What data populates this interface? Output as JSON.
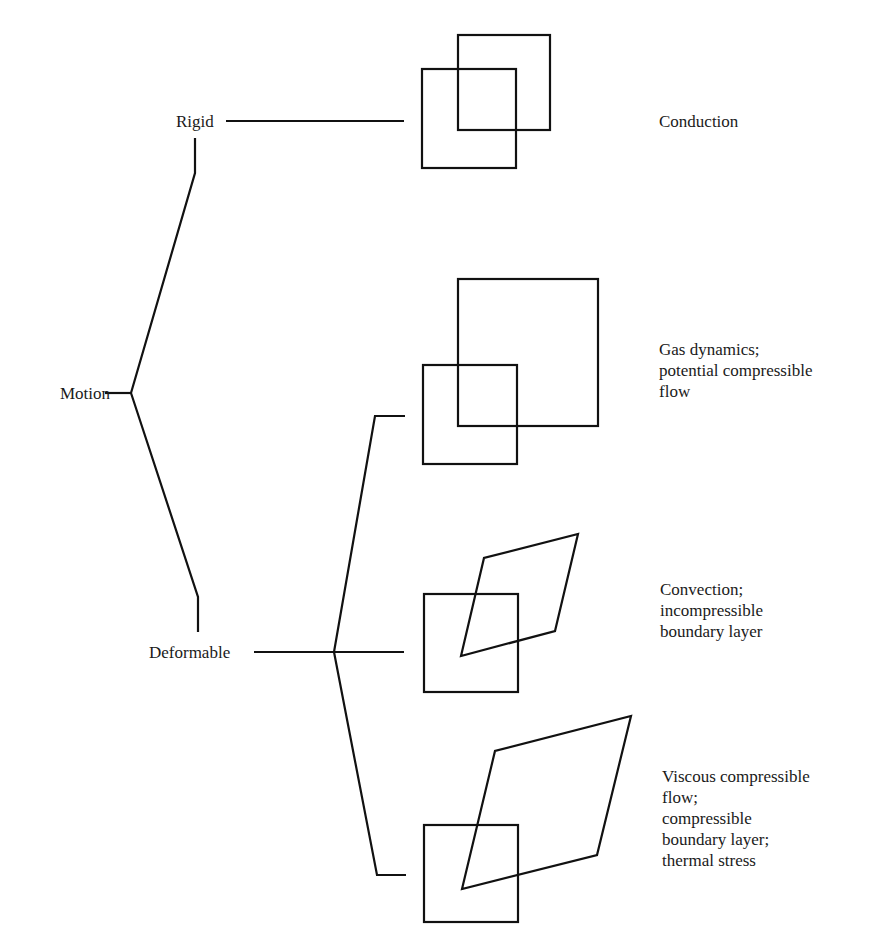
{
  "diagram": {
    "root": {
      "label": "Motion"
    },
    "branches": [
      {
        "label": "Rigid"
      },
      {
        "label": "Deformable"
      }
    ],
    "cases": [
      {
        "parent": "Rigid",
        "shape": "two-translated-squares",
        "description_lines": [
          "Conduction"
        ]
      },
      {
        "parent": "Deformable",
        "shape": "square-and-dilated-square",
        "description_lines": [
          "Gas dynamics;",
          "potential compressible",
          "flow"
        ]
      },
      {
        "parent": "Deformable",
        "shape": "square-and-sheared-rhombus",
        "description_lines": [
          "Convection;",
          "incompressible",
          "boundary layer"
        ]
      },
      {
        "parent": "Deformable",
        "shape": "square-and-sheared-dilated-rhombus",
        "description_lines": [
          "Viscous compressible",
          "flow;",
          "compressible",
          "boundary layer;",
          "thermal stress"
        ]
      }
    ],
    "colors": {
      "line": "#111111",
      "text": "#1a1a1a",
      "background": "#ffffff"
    }
  }
}
